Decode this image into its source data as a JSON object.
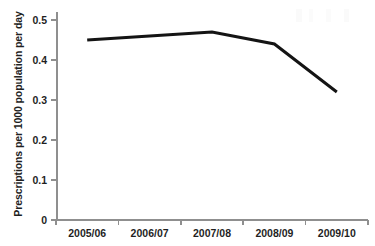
{
  "chart_data": {
    "type": "line",
    "title": "",
    "xlabel": "",
    "ylabel": "Prescriptions per 1000 population per day",
    "categories": [
      "2005/06",
      "2006/07",
      "2007/08",
      "2008/09",
      "2009/10"
    ],
    "values": [
      0.45,
      0.46,
      0.47,
      0.44,
      0.32
    ],
    "series": [
      {
        "name": "Prescriptions per 1000 population per day",
        "values": [
          0.45,
          0.46,
          0.47,
          0.44,
          0.32
        ]
      }
    ],
    "ylim": [
      0,
      0.5
    ],
    "ytick_labels": [
      "0",
      "0.1",
      "0.2",
      "0.3",
      "0.4",
      "0.5"
    ],
    "ytick_values": [
      0,
      0.1,
      0.2,
      0.3,
      0.4,
      0.5
    ],
    "grid": false,
    "legend": false,
    "legend_position": "none",
    "markers": false,
    "line_color": "#141414",
    "axis_color": "#8f8f8f"
  }
}
